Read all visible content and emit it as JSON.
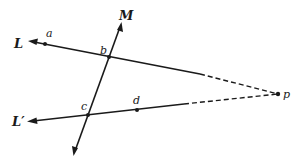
{
  "figure": {
    "type": "geometry-diagram",
    "lines": [
      {
        "id": "L",
        "label": "L",
        "style": "solid-then-dashed",
        "direction": "arrow at left end",
        "passes_through": [
          "a",
          "b"
        ],
        "converges_to": "p"
      },
      {
        "id": "L_prime",
        "label": "L′",
        "style": "solid-then-dashed",
        "direction": "arrow at left end",
        "passes_through": [
          "c",
          "d"
        ],
        "converges_to": "p"
      },
      {
        "id": "M",
        "label": "M",
        "style": "solid",
        "direction": "arrows at both ends",
        "passes_through": [
          "b",
          "c"
        ]
      }
    ],
    "points": [
      {
        "id": "a",
        "label": "a"
      },
      {
        "id": "b",
        "label": "b"
      },
      {
        "id": "c",
        "label": "c"
      },
      {
        "id": "d",
        "label": "d"
      },
      {
        "id": "p",
        "label": "p"
      }
    ]
  },
  "labels": {
    "L": "L",
    "L_prime": "L′",
    "M": "M",
    "a": "a",
    "b": "b",
    "c": "c",
    "d": "d",
    "p": "p"
  },
  "colors": {
    "ink": "#1a1a1a",
    "background": "#ffffff"
  }
}
